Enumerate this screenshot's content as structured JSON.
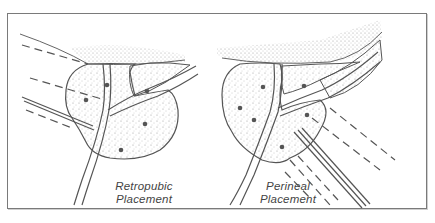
{
  "figure": {
    "panels": [
      {
        "id": "retropubic",
        "label_line1": "Retropubic",
        "label_line2": "Placement"
      },
      {
        "id": "perineal",
        "label_line1": "Perineal",
        "label_line2": "Placement"
      }
    ],
    "colors": {
      "line": "#555555",
      "stipple": "#777777",
      "frame": "#7a7a7a",
      "background": "#ffffff"
    }
  }
}
